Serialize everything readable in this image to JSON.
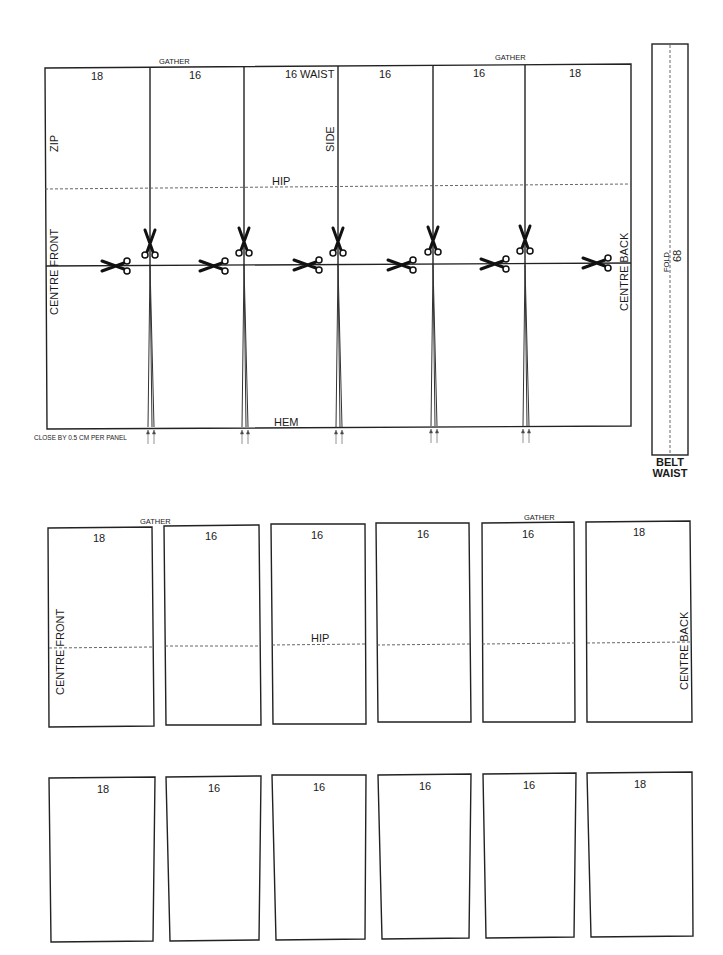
{
  "pattern": {
    "top_layout": {
      "gather_labels": [
        "GATHER",
        "GATHER"
      ],
      "panel_widths": [
        "18",
        "16",
        "16",
        "16",
        "16",
        "18"
      ],
      "waist_label": "WAIST",
      "side_label": "SIDE",
      "zip_label": "ZIP",
      "hip_label": "HIP",
      "hem_label": "HEM",
      "centre_front_label": "CENTRE FRONT",
      "centre_back_label": "CENTRE BACK",
      "close_note": "CLOSE BY 0.5 CM PER PANEL",
      "scissors_count": 11
    },
    "belt": {
      "length": "68",
      "fold_label": "FOLD",
      "title_line1": "BELT",
      "title_line2": "WAIST"
    },
    "separated_panels": {
      "gather_labels": [
        "GATHER",
        "GATHER"
      ],
      "hip_label": "HIP",
      "centre_front_label": "CENTRE FRONT",
      "centre_back_label": "CENTRE BACK",
      "panel_widths": [
        "18",
        "16",
        "16",
        "16",
        "16",
        "18"
      ]
    },
    "flared_panels": {
      "panel_widths": [
        "18",
        "16",
        "16",
        "16",
        "16",
        "18"
      ]
    }
  }
}
